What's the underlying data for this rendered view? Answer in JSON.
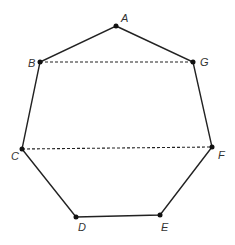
{
  "diagram": {
    "type": "heptagon",
    "stroke_color": "#222222",
    "vertices": [
      {
        "name": "A",
        "x": 116,
        "y": 26,
        "lx": 121,
        "ly": 22
      },
      {
        "name": "G",
        "x": 193,
        "y": 62,
        "lx": 200,
        "ly": 66
      },
      {
        "name": "F",
        "x": 212,
        "y": 147,
        "lx": 218,
        "ly": 159
      },
      {
        "name": "E",
        "x": 160,
        "y": 215,
        "lx": 161,
        "ly": 231
      },
      {
        "name": "D",
        "x": 76,
        "y": 217,
        "lx": 78,
        "ly": 231
      },
      {
        "name": "C",
        "x": 22,
        "y": 149,
        "lx": 11,
        "ly": 160
      },
      {
        "name": "B",
        "x": 40,
        "y": 62,
        "lx": 28,
        "ly": 67
      }
    ],
    "dashed_segments": [
      {
        "from": "B",
        "to": "G"
      },
      {
        "from": "C",
        "to": "F"
      }
    ],
    "labels": {
      "A": "A",
      "B": "B",
      "C": "C",
      "D": "D",
      "E": "E",
      "F": "F",
      "G": "G"
    }
  }
}
